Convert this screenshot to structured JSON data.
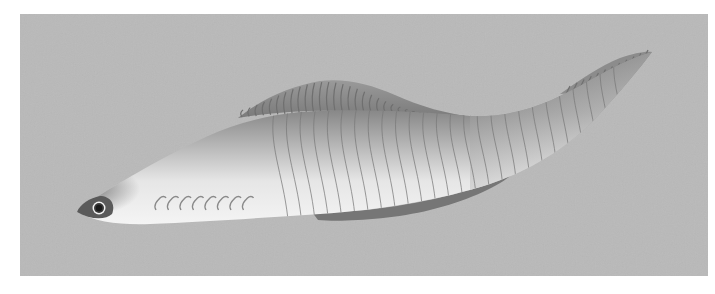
{
  "image": {
    "subject": "prehistoric jawless fish illustration",
    "style": "grayscale airbrushed rendering",
    "colors": {
      "page_background": "#ffffff",
      "panel_background": "#b9b9b9",
      "body_dark": "#6a6a6a",
      "body_mid": "#9c9c9c",
      "body_light": "#ececec",
      "fin_fill": "#8e8e8e",
      "fin_ridge": "#6f6f6f",
      "ventral_fin": "#767676",
      "myomere_line": "#7a7a7a",
      "eye_ring": "#f2f2f2",
      "eye_pupil": "#1a1a1a"
    },
    "features": {
      "myomere_count": 26,
      "dorsal_fin_ray_count": 34,
      "tail_fin_ray_count": 12,
      "gill_slit_count": 8
    }
  }
}
